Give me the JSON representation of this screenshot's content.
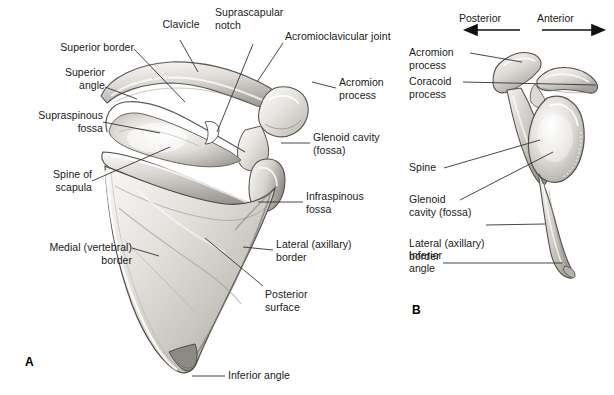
{
  "figure": {
    "background_color": "#ffffff",
    "text_color": "#1a1a1a",
    "leader_line_color": "#333333",
    "bone_fill": "#e8e6e3",
    "bone_shadow": "#9b9893"
  },
  "panels": [
    {
      "id": "A",
      "marker": "A",
      "view": "posterior view of right scapula with clavicle"
    },
    {
      "id": "B",
      "marker": "B",
      "view": "lateral view of right scapula"
    }
  ],
  "panel_a": {
    "marker": "A",
    "labels": [
      {
        "name": "clavicle",
        "text": "Clavicle",
        "align": "center"
      },
      {
        "name": "suprascapular-notch",
        "text": "Suprascapular\nnotch",
        "align": "left"
      },
      {
        "name": "acromioclavicular-joint",
        "text": "Acromioclavicular joint",
        "align": "left"
      },
      {
        "name": "superior-border",
        "text": "Superior border",
        "align": "right"
      },
      {
        "name": "superior-angle",
        "text": "Superior\nangle",
        "align": "right"
      },
      {
        "name": "supraspinous-fossa",
        "text": "Supraspinous\nfossa",
        "align": "right"
      },
      {
        "name": "spine-of-scapula",
        "text": "Spine of\nscapula",
        "align": "right"
      },
      {
        "name": "medial-vertebral-border",
        "text": "Medial (vertebral)\nborder",
        "align": "right"
      },
      {
        "name": "acromion-process",
        "text": "Acromion\nprocess",
        "align": "left"
      },
      {
        "name": "glenoid-cavity-fossa",
        "text": "Glenoid cavity\n(fossa)",
        "align": "left"
      },
      {
        "name": "infraspinous-fossa",
        "text": "Infraspinous\nfossa",
        "align": "left"
      },
      {
        "name": "lateral-axillary-border",
        "text": "Lateral (axillary)\nborder",
        "align": "left"
      },
      {
        "name": "posterior-surface",
        "text": "Posterior\nsurface",
        "align": "left"
      },
      {
        "name": "inferior-angle",
        "text": "Inferior angle",
        "align": "left"
      }
    ]
  },
  "panel_b": {
    "marker": "B",
    "direction_labels": [
      {
        "name": "posterior-direction",
        "text": "Posterior",
        "arrow": "left"
      },
      {
        "name": "anterior-direction",
        "text": "Anterior",
        "arrow": "right"
      }
    ],
    "labels": [
      {
        "name": "acromion-process",
        "text": "Acromion\nprocess",
        "align": "left"
      },
      {
        "name": "coracoid-process",
        "text": "Coracoid\nprocess",
        "align": "left"
      },
      {
        "name": "spine",
        "text": "Spine",
        "align": "left"
      },
      {
        "name": "glenoid-cavity-fossa",
        "text": "Glenoid\ncavity (fossa)",
        "align": "left"
      },
      {
        "name": "lateral-axillary-border",
        "text": "Lateral (axillary)\nborder",
        "align": "left"
      },
      {
        "name": "inferior-angle",
        "text": "Inferior\nangle",
        "align": "left"
      }
    ]
  }
}
